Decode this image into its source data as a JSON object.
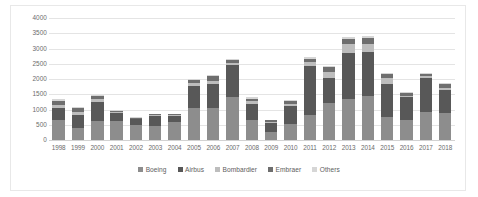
{
  "chart_data": {
    "type": "bar",
    "stacked": true,
    "title": "",
    "xlabel": "",
    "ylabel": "",
    "ylim": [
      0,
      4000
    ],
    "ytick_step": 500,
    "yticks": [
      "4000",
      "3500",
      "3000",
      "2500",
      "2000",
      "1500",
      "1000",
      "500",
      "0"
    ],
    "grid": true,
    "legend_position": "bottom",
    "categories": [
      "1998",
      "1999",
      "2000",
      "2001",
      "2002",
      "2003",
      "2004",
      "2005",
      "2006",
      "2007",
      "2008",
      "2009",
      "2010",
      "2011",
      "2012",
      "2013",
      "2014",
      "2015",
      "2016",
      "2017",
      "2018"
    ],
    "series": [
      {
        "name": "Boeing",
        "color": "#8d8d8d",
        "values": [
          660,
          410,
          610,
          610,
          500,
          470,
          600,
          1050,
          1050,
          1420,
          670,
          260,
          530,
          805,
          1200,
          1355,
          1430,
          768,
          668,
          912,
          893
        ]
      },
      {
        "name": "Airbus",
        "color": "#585858",
        "values": [
          380,
          410,
          640,
          270,
          180,
          310,
          180,
          720,
          790,
          1040,
          500,
          310,
          574,
          1608,
          830,
          1503,
          1456,
          1080,
          731,
          1109,
          747
        ]
      },
      {
        "name": "Bombardier",
        "color": "#bdbdbd",
        "values": [
          110,
          90,
          110,
          40,
          25,
          35,
          35,
          90,
          110,
          80,
          115,
          30,
          80,
          130,
          190,
          280,
          270,
          170,
          55,
          70,
          60
        ]
      },
      {
        "name": "Embraer",
        "color": "#6e6e6e",
        "values": [
          145,
          130,
          70,
          45,
          20,
          30,
          30,
          110,
          140,
          90,
          70,
          45,
          110,
          130,
          160,
          180,
          200,
          150,
          90,
          90,
          150
        ]
      },
      {
        "name": "Others",
        "color": "#d6d6d6",
        "values": [
          50,
          40,
          50,
          25,
          20,
          20,
          20,
          40,
          50,
          40,
          40,
          20,
          30,
          40,
          50,
          60,
          70,
          40,
          25,
          30,
          30
        ]
      }
    ],
    "totals": [
      1345,
      1080,
      1480,
      990,
      745,
      865,
      865,
      2010,
      2140,
      2670,
      1395,
      665,
      1324,
      2713,
      2430,
      3378,
      3426,
      2208,
      1569,
      2211,
      1880
    ]
  },
  "legend": {
    "items": [
      {
        "label": "Boeing"
      },
      {
        "label": "Airbus"
      },
      {
        "label": "Bombardier"
      },
      {
        "label": "Embraer"
      },
      {
        "label": "Others"
      }
    ]
  }
}
